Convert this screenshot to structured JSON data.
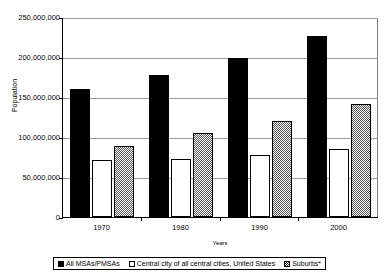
{
  "chart_data": {
    "type": "bar",
    "title": "",
    "xlabel": "Years",
    "ylabel": "Population",
    "categories": [
      "1970",
      "1980",
      "1990",
      "2000"
    ],
    "series": [
      {
        "name": "All MSAs/PMSAs",
        "style": "solid-black",
        "values": [
          160000000,
          177500000,
          199000000,
          226000000
        ]
      },
      {
        "name": "Central city of all central cities, United States",
        "style": "white-outline",
        "values": [
          71000000,
          72000000,
          77000000,
          85000000
        ]
      },
      {
        "name": "Suburbs*",
        "style": "checkerboard-hatch",
        "values": [
          88500000,
          105000000,
          120500000,
          141000000
        ]
      }
    ],
    "ylim": [
      0,
      250000000
    ],
    "ytick_values": [
      0,
      50000000,
      100000000,
      150000000,
      200000000,
      250000000
    ],
    "ytick_labels": [
      "0",
      "50,000,000",
      "100,000,000",
      "150,000,000",
      "200,000,000",
      "250,000,000"
    ],
    "grid": true,
    "legend_position": "bottom"
  },
  "legend": {
    "items": [
      {
        "label": "All MSAs/PMSAs"
      },
      {
        "label": "Central city of all central cities, United States"
      },
      {
        "label": "Suburbs*"
      }
    ]
  }
}
